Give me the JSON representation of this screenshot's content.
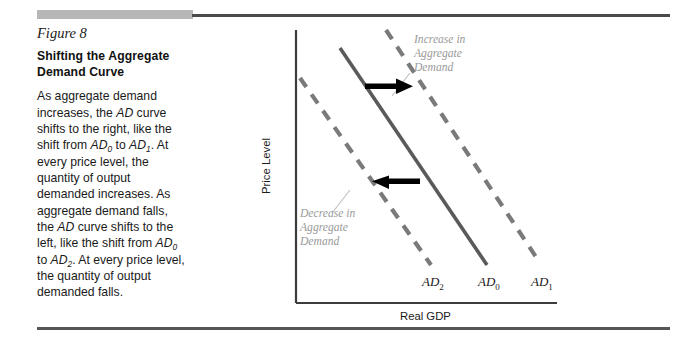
{
  "figure": {
    "number_label": "Figure 8",
    "title_line1": "Shifting the Aggregate",
    "title_line2": "Demand Curve",
    "body_text": "As aggregate demand increases, the AD curve shifts to the right, like the shift from AD0 to AD1. At every price level, the quantity of output demanded increases. As aggregate demand falls, the AD curve shifts to the left, like the shift from AD0 to AD2. At every price level, the quantity of output demanded falls."
  },
  "colors": {
    "rule": "#4a4a4a",
    "gray_block": "#b7b7b7",
    "axis": "#3c3c3c",
    "solid_curve": "#5a5a5a",
    "dashed_curve": "#7a7a7a",
    "arrow": "#000000",
    "annotation_text": "#9a9a9a",
    "leader_line": "#b0b0b0"
  },
  "chart_data": {
    "type": "line",
    "title": "Shifting the Aggregate Demand Curve",
    "xlabel": "Real GDP",
    "ylabel": "Price Level",
    "grid": false,
    "legend": "none",
    "axis_ticks": [],
    "series": [
      {
        "name": "AD2",
        "label": "AD",
        "subscript": "2",
        "style": "dashed",
        "color": "#7a7a7a",
        "description": "Aggregate demand curve after a decrease; shifted left of AD0",
        "points": [
          [
            0.055,
            0.915
          ],
          [
            0.47,
            0.215
          ]
        ]
      },
      {
        "name": "AD0",
        "label": "AD",
        "subscript": "0",
        "style": "solid",
        "color": "#5a5a5a",
        "description": "Original aggregate demand curve",
        "points": [
          [
            0.22,
            1.03
          ],
          [
            0.635,
            0.23
          ]
        ]
      },
      {
        "name": "AD1",
        "label": "AD",
        "subscript": "1",
        "style": "dashed",
        "color": "#7a7a7a",
        "description": "Aggregate demand curve after an increase; shifted right of AD0",
        "points": [
          [
            0.395,
            1.1
          ],
          [
            0.835,
            0.235
          ]
        ]
      }
    ],
    "annotations": [
      {
        "name": "increase-annotation",
        "lines": [
          "Increase in",
          "Aggregate",
          "Demand"
        ],
        "color": "#9a9a9a",
        "points_to": "AD1"
      },
      {
        "name": "decrease-annotation",
        "lines": [
          "Decrease in",
          "Aggregate",
          "Demand"
        ],
        "color": "#9a9a9a",
        "points_to": "AD2"
      }
    ],
    "arrows": [
      {
        "name": "rightward-shift-arrow",
        "direction": "right",
        "meaning": "AD0 shifts right to AD1"
      },
      {
        "name": "leftward-shift-arrow",
        "direction": "left",
        "meaning": "AD0 shifts left to AD2"
      }
    ]
  },
  "labels": {
    "ad2": "AD",
    "ad2_sub": "2",
    "ad0": "AD",
    "ad0_sub": "0",
    "ad1": "AD",
    "ad1_sub": "1",
    "y_axis": "Price Level",
    "x_axis": "Real GDP",
    "increase_l1": "Increase in",
    "increase_l2": "Aggregate",
    "increase_l3": "Demand",
    "decrease_l1": "Decrease in",
    "decrease_l2": "Aggregate",
    "decrease_l3": "Demand"
  }
}
